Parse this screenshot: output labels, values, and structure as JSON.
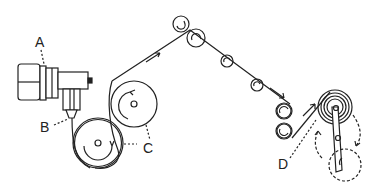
{
  "diagram": {
    "type": "film/tape transport schematic",
    "labels": {
      "a": "A",
      "b": "B",
      "c": "C",
      "d": "D"
    },
    "components": [
      {
        "id": "A",
        "name": "drive-unit"
      },
      {
        "id": "B",
        "name": "nozzle-head"
      },
      {
        "id": "C",
        "name": "supply-spool"
      },
      {
        "id": "D",
        "name": "take-up-spool-with-swing-arm"
      }
    ],
    "colors": {
      "line": "#222222",
      "background": "#ffffff"
    }
  }
}
